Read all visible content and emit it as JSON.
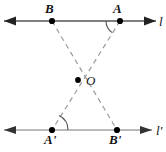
{
  "figure": {
    "kind": "geometry-diagram",
    "width": 166,
    "height": 152,
    "background": "#ffffff",
    "stroke_solid": "#555555",
    "stroke_dashed": "#999999",
    "point_color": "#000000",
    "label_color": "#111111"
  },
  "lines": [
    {
      "id": "l",
      "label": "l",
      "y": 21,
      "x_start": 4,
      "x_end": 156,
      "arrow_start": true,
      "arrow_end": true,
      "label_x": 159,
      "label_y": 15
    },
    {
      "id": "l_prime",
      "label": "l'",
      "y": 130,
      "x_start": 4,
      "x_end": 152,
      "arrow_start": true,
      "arrow_end": true,
      "label_x": 156,
      "label_y": 124
    }
  ],
  "points": [
    {
      "id": "B",
      "label": "B",
      "x": 52,
      "y": 21,
      "label_x": 45,
      "label_y": 2
    },
    {
      "id": "A",
      "label": "A",
      "x": 120,
      "y": 21,
      "label_x": 113,
      "label_y": 2
    },
    {
      "id": "O",
      "label": "O",
      "x": 78,
      "y": 80,
      "label_x": 86,
      "label_y": 74
    },
    {
      "id": "Ap",
      "label": "A'",
      "x": 52,
      "y": 130,
      "label_x": 44,
      "label_y": 133
    },
    {
      "id": "Bp",
      "label": "B'",
      "x": 117,
      "y": 130,
      "label_x": 109,
      "label_y": 133
    }
  ],
  "dashed_segments": [
    {
      "id": "B-to-Bprime",
      "from": "B",
      "to": "Bp"
    },
    {
      "id": "A-to-Aprime",
      "from": "A",
      "to": "Ap"
    }
  ],
  "angle_arcs": [
    {
      "id": "angle-at-A",
      "vertex": "A",
      "opens": "down-left"
    },
    {
      "id": "angle-at-Ap",
      "vertex": "Ap",
      "opens": "up-right"
    }
  ]
}
